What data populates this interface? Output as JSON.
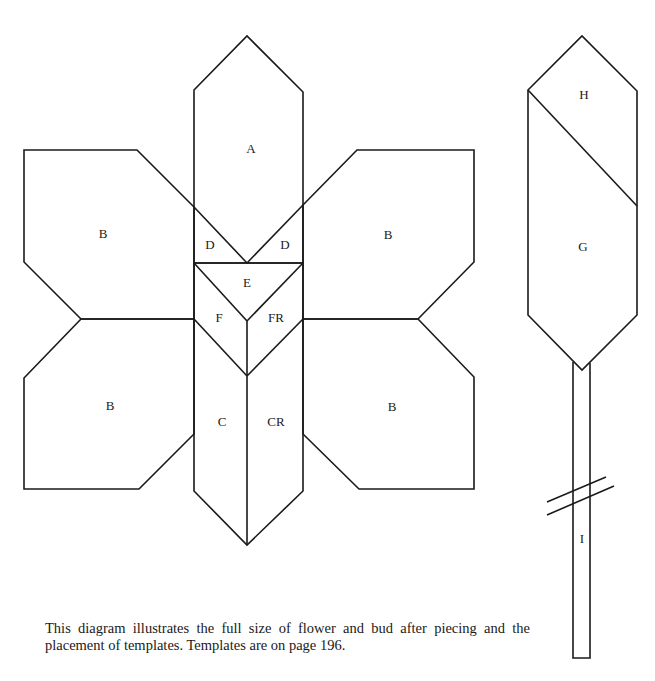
{
  "diagram": {
    "flower": {
      "labels": {
        "A": "A",
        "B_upper_left": "B",
        "B_upper_right": "B",
        "B_lower_left": "B",
        "B_lower_right": "B",
        "D_left": "D",
        "D_right": "D",
        "E": "E",
        "F": "F",
        "FR": "FR",
        "C": "C",
        "CR": "CR"
      }
    },
    "bud": {
      "labels": {
        "H": "H",
        "G": "G",
        "I": "I"
      }
    }
  },
  "caption": "This diagram illustrates the full size of flower and bud after piecing and the placement of templates. Templates are on page 196."
}
